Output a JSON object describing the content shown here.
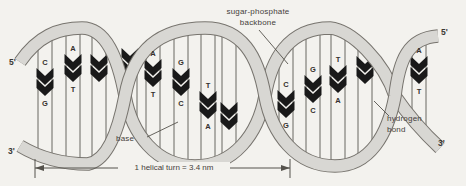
{
  "figure": {
    "name": "DNA double helix structure diagram",
    "labels": {
      "backbone_line1": "sugar-phosphate",
      "backbone_line2": "backbone",
      "base": "base",
      "hbond_line1": "hydrogen",
      "hbond_line2": "bond",
      "turn": "1 helical turn = 3.4 nm"
    },
    "ends": {
      "left_top": "5'",
      "left_bottom": "3'",
      "right_top": "5'",
      "right_bottom": "3'"
    },
    "base_pairs": [
      {
        "x": 45,
        "cy": 82,
        "top": "C",
        "bottom": "G"
      },
      {
        "x": 73,
        "cy": 68,
        "top": "A",
        "bottom": "T"
      },
      {
        "x": 99,
        "cy": 68,
        "top": null,
        "bottom": null
      },
      {
        "x": 130,
        "cy": 62,
        "top": null,
        "bottom": null
      },
      {
        "x": 153,
        "cy": 73,
        "top": "A",
        "bottom": "T"
      },
      {
        "x": 181,
        "cy": 82,
        "top": "G",
        "bottom": "C"
      },
      {
        "x": 208,
        "cy": 105,
        "top": "T",
        "bottom": "A"
      },
      {
        "x": 229,
        "cy": 116,
        "top": null,
        "bottom": null
      },
      {
        "x": 286,
        "cy": 104,
        "top": "C",
        "bottom": "G"
      },
      {
        "x": 313,
        "cy": 89,
        "top": "G",
        "bottom": "C"
      },
      {
        "x": 338,
        "cy": 79,
        "top": "T",
        "bottom": "A"
      },
      {
        "x": 365,
        "cy": 70,
        "top": null,
        "bottom": null
      },
      {
        "x": 419,
        "cy": 70,
        "top": "A",
        "bottom": "T"
      }
    ],
    "colors": {
      "background": "#f3f2ee",
      "ribbon_fill": "#d8d7d3",
      "ribbon_edge": "#77746e",
      "rung_line": "#5a5751",
      "base_shape": "#191919",
      "letter": "#33302c",
      "annotation": "#45413b",
      "dimension": "#55524c"
    }
  }
}
